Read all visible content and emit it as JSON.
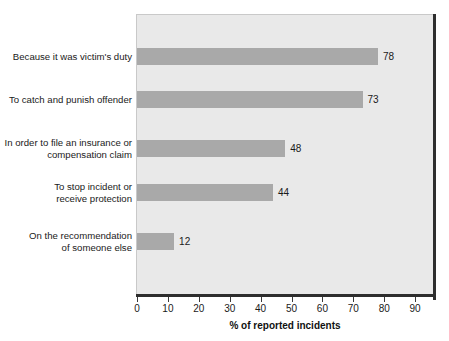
{
  "chart_data": {
    "type": "bar",
    "orientation": "horizontal",
    "title": "",
    "xlabel": "% of reported incidents",
    "ylabel": "",
    "xlim": [
      0,
      97
    ],
    "xticks": [
      0,
      10,
      20,
      30,
      40,
      50,
      60,
      70,
      80,
      90
    ],
    "xtick_labels": [
      "0",
      "10",
      "20",
      "30",
      "40",
      "50",
      "60",
      "70",
      "80",
      "90"
    ],
    "grid": false,
    "legend": null,
    "bar_color": "#a9a9a9",
    "plot_background": "#e9e9e9",
    "categories": [
      "Because it was victim's duty",
      "To catch and punish offender",
      "In order to file an insurance or\ncompensation claim",
      "To stop incident or\nreceive protection",
      "On the recommendation\nof someone else"
    ],
    "values": [
      78,
      73,
      48,
      44,
      12
    ],
    "value_labels": [
      "78",
      "73",
      "48",
      "44",
      "12"
    ]
  },
  "axis": {
    "title": "% of reported incidents"
  }
}
